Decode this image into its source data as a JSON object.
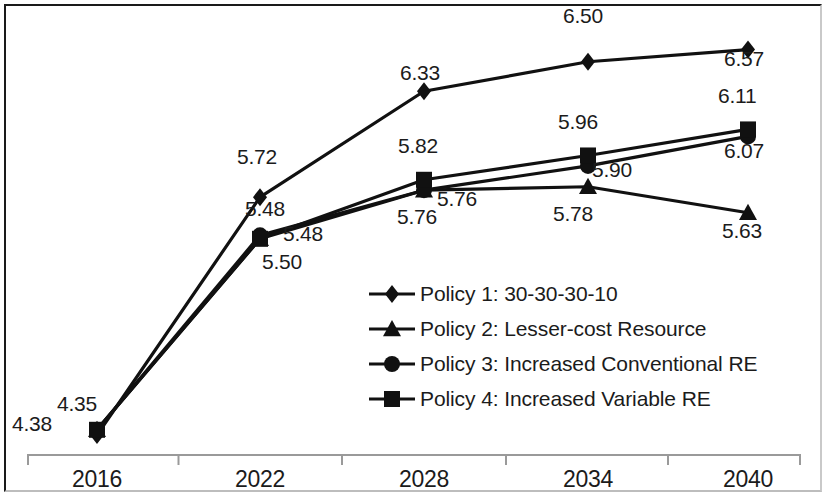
{
  "chart_data": {
    "type": "line",
    "title": "",
    "subtitle": "",
    "xlabel": "",
    "ylabel": "",
    "categories": [
      "2016",
      "2022",
      "2028",
      "2034",
      "2040"
    ],
    "xlim": [
      2016,
      2040
    ],
    "ylim": [
      4.2,
      6.7
    ],
    "grid": false,
    "legend_position": "center",
    "series": [
      {
        "name": "Policy 1: 30-30-30-10",
        "marker": "diamond",
        "values": [
          4.35,
          5.72,
          6.33,
          6.5,
          6.57
        ],
        "labels": [
          "4.35",
          "5.72",
          "6.33",
          "6.50",
          "6.57"
        ]
      },
      {
        "name": "Policy 2: Lesser-cost Resource",
        "marker": "triangle",
        "values": [
          4.38,
          5.48,
          5.76,
          5.78,
          5.63
        ],
        "labels": [
          "4.38",
          "5.48",
          "5.76",
          "5.78",
          "5.63"
        ]
      },
      {
        "name": "Policy 3: Increased Conventional RE",
        "marker": "circle",
        "values": [
          4.38,
          5.5,
          5.76,
          5.9,
          6.07
        ],
        "labels": [
          "4.38",
          "5.50",
          "5.76",
          "5.90",
          "6.07"
        ]
      },
      {
        "name": "Policy 4: Increased Variable RE",
        "marker": "square",
        "values": [
          4.38,
          5.48,
          5.82,
          5.96,
          6.11
        ],
        "labels": [
          "4.38",
          "5.48",
          "5.82",
          "5.96",
          "6.11"
        ]
      }
    ],
    "point_labels": [
      {
        "text": "4.38",
        "x": 12,
        "y": 412
      },
      {
        "text": "4.35",
        "x": 57,
        "y": 392
      },
      {
        "text": "5.72",
        "x": 237,
        "y": 145
      },
      {
        "text": "5.48",
        "x": 245,
        "y": 197
      },
      {
        "text": "5.48",
        "x": 283,
        "y": 222
      },
      {
        "text": "5.50",
        "x": 262,
        "y": 250
      },
      {
        "text": "6.33",
        "x": 400,
        "y": 61
      },
      {
        "text": "5.82",
        "x": 398,
        "y": 134
      },
      {
        "text": "5.76",
        "x": 437,
        "y": 187
      },
      {
        "text": "5.76",
        "x": 397,
        "y": 205
      },
      {
        "text": "6.50",
        "x": 563,
        "y": 4
      },
      {
        "text": "5.96",
        "x": 558,
        "y": 110
      },
      {
        "text": "5.90",
        "x": 592,
        "y": 158
      },
      {
        "text": "5.78",
        "x": 553,
        "y": 202
      },
      {
        "text": "6.57",
        "x": 724,
        "y": 47
      },
      {
        "text": "6.11",
        "x": 718,
        "y": 84
      },
      {
        "text": "6.07",
        "x": 724,
        "y": 139
      },
      {
        "text": "5.63",
        "x": 722,
        "y": 219
      }
    ],
    "axis_tick_positions": [
      97,
      260,
      424,
      588,
      748
    ]
  },
  "colors": {
    "line": "#111111",
    "axis": "#9a9a9a",
    "frame": "#1a1a1a",
    "text": "#1b1b1b",
    "background": "#ffffff"
  }
}
